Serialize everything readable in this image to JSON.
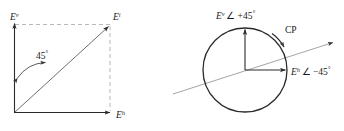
{
  "figure": {
    "title": "",
    "panels": [
      {
        "id": "linear-polarization-square",
        "labels": {
          "vertical_axis": "E",
          "vertical_axis_sup": "v",
          "horizontal_axis": "E",
          "horizontal_axis_sup": "h",
          "resultant": "E",
          "resultant_sup": "i",
          "angle": "45",
          "angle_degree_symbol": "°"
        }
      },
      {
        "id": "circular-polarization-circle",
        "labels": {
          "vertical_component": "E",
          "vertical_component_sup": "v",
          "vertical_component_phase": "∠ +45",
          "vertical_component_degree": "°",
          "horizontal_component": "E",
          "horizontal_component_sup": "h",
          "horizontal_component_phase": "∠ −45",
          "horizontal_component_degree": "°",
          "rotation_sense": "CP"
        }
      }
    ],
    "colors": {
      "stroke_solid": "#2b2b2b",
      "stroke_dashed": "#b8b8b8",
      "stroke_thin": "#8c8c8c",
      "text": "#1a1a1a",
      "background": "#ffffff"
    }
  }
}
